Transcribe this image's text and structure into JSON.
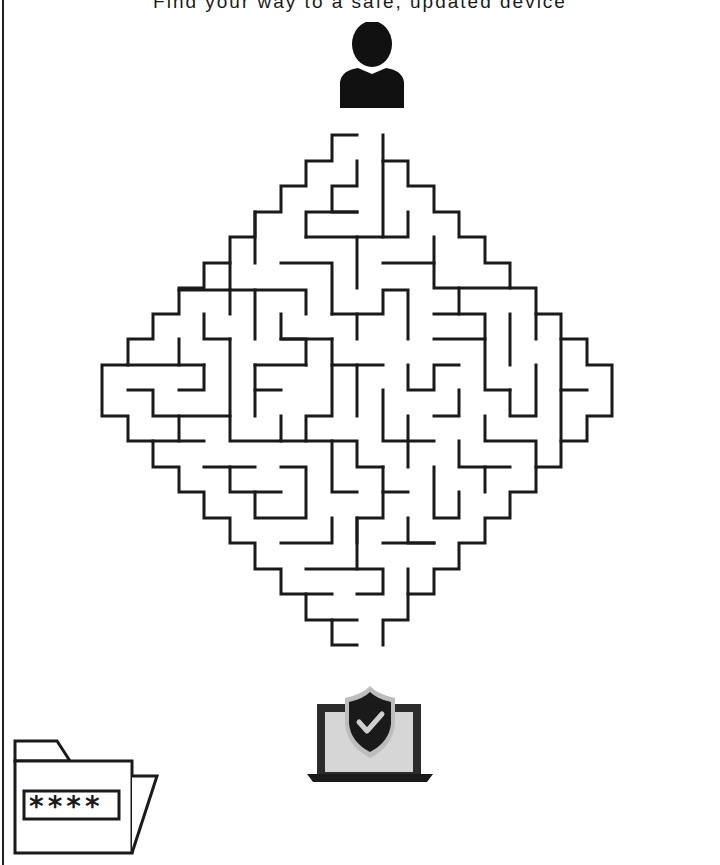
{
  "page": {
    "title": "Find your way to a safe, updated device"
  },
  "icons": {
    "start": "person-icon",
    "goal": "laptop-shield-check-icon",
    "corner": "password-folder-icon"
  },
  "password_folder": {
    "mask": "****"
  },
  "maze": {
    "shape": "diamond",
    "cell_size": 25.5,
    "stroke_color": "#1a1a1a",
    "start_label": "entry-top",
    "end_label": "exit-bottom"
  },
  "colors": {
    "ink": "#1a1a1a",
    "laptop_screen": "#d6d6d6",
    "shield_stroke": "#bdbdbd",
    "background": "#ffffff"
  }
}
